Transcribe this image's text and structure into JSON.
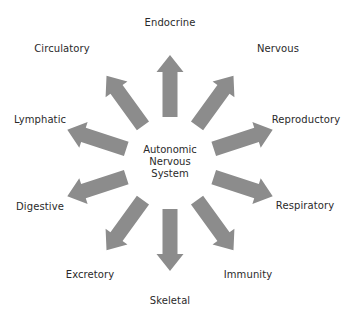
{
  "diagram": {
    "center_label": [
      "Autonomic",
      "Nervous",
      "System"
    ],
    "arrow_color": "#8c8c8c",
    "systems": [
      {
        "label": "Endocrine",
        "angle": 0,
        "x": 170,
        "y": 22
      },
      {
        "label": "Nervous",
        "angle": 36,
        "x": 278,
        "y": 48
      },
      {
        "label": "Reproductory",
        "angle": 72,
        "x": 306,
        "y": 119
      },
      {
        "label": "Respiratory",
        "angle": 108,
        "x": 305,
        "y": 205
      },
      {
        "label": "Immunity",
        "angle": 144,
        "x": 248,
        "y": 274
      },
      {
        "label": "Skeletal",
        "angle": 180,
        "x": 170,
        "y": 300
      },
      {
        "label": "Excretory",
        "angle": 216,
        "x": 90,
        "y": 274
      },
      {
        "label": "Digestive",
        "angle": 252,
        "x": 40,
        "y": 206
      },
      {
        "label": "Lymphatic",
        "angle": 288,
        "x": 40,
        "y": 119
      },
      {
        "label": "Circulatory",
        "angle": 324,
        "x": 62,
        "y": 48
      }
    ]
  }
}
